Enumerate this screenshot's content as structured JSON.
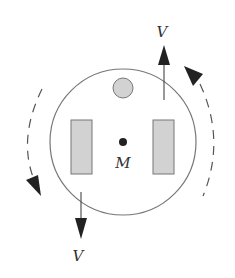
{
  "diagram": {
    "type": "rotating-body-velocity-diagram",
    "colors": {
      "outline": "#777777",
      "fill": "#d2d2d2",
      "ink": "#222222",
      "dashed": "#555555"
    },
    "labels": {
      "center": "M",
      "velocity_top": "V",
      "velocity_bottom": "V"
    },
    "elements": {
      "main_circle": {
        "cx": 123,
        "cy": 142,
        "r": 73
      },
      "small_circle": {
        "cx": 123,
        "cy": 88,
        "r": 10
      },
      "left_rect": {
        "x": 71,
        "y": 120,
        "w": 21,
        "h": 54
      },
      "right_rect": {
        "x": 153,
        "y": 120,
        "w": 21,
        "h": 54
      },
      "center_dot": {
        "cx": 123,
        "cy": 142,
        "r": 4
      },
      "velocity_arrow_top": {
        "x": 164,
        "from_y": 100,
        "to_y": 45,
        "direction": "up"
      },
      "velocity_arrow_bottom": {
        "x": 81,
        "from_y": 192,
        "to_y": 238,
        "direction": "down"
      },
      "rotation_arc_right": {
        "direction": "counterclockwise-indicator",
        "arrow_at": "top"
      },
      "rotation_arc_left": {
        "direction": "counterclockwise-indicator",
        "arrow_at": "bottom"
      }
    }
  }
}
